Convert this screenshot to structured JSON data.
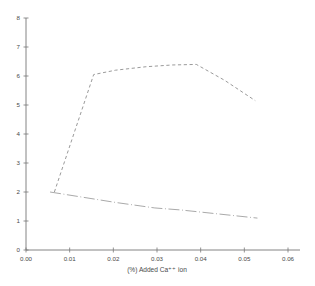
{
  "chart_data": {
    "type": "line",
    "title": "",
    "subtitle": "",
    "xlabel": "(%) Added Ca⁺⁺ ion",
    "ylabel": "",
    "xlim": [
      0.0,
      0.06
    ],
    "ylim": [
      0,
      8
    ],
    "grid": false,
    "legend": "none",
    "x_ticks": [
      0.0,
      0.01,
      0.02,
      0.03,
      0.04,
      0.05,
      0.06
    ],
    "x_tick_labels": [
      "0.00",
      "0.01",
      "0.02",
      "0.03",
      "0.04",
      "0.05",
      "0.06"
    ],
    "y_ticks": [
      0,
      1,
      2,
      3,
      4,
      5,
      6,
      7,
      8
    ],
    "y_tick_labels": [
      "0",
      "1",
      "2",
      "3",
      "4",
      "5",
      "6",
      "7",
      "8"
    ],
    "series": [
      {
        "name": "upper-dashed-curve",
        "style": "dashed",
        "color": "#888888",
        "points": [
          [
            0.0065,
            2.0
          ],
          [
            0.0155,
            6.05
          ],
          [
            0.0205,
            6.2
          ],
          [
            0.0275,
            6.32
          ],
          [
            0.0335,
            6.38
          ],
          [
            0.039,
            6.4
          ],
          [
            0.0455,
            5.85
          ],
          [
            0.0525,
            5.15
          ]
        ]
      },
      {
        "name": "lower-dashdot-line",
        "style": "dash-dot",
        "color": "#999999",
        "points": [
          [
            0.0055,
            2.0
          ],
          [
            0.0205,
            1.64
          ],
          [
            0.0295,
            1.45
          ],
          [
            0.0355,
            1.38
          ],
          [
            0.053,
            1.1
          ]
        ]
      }
    ]
  },
  "axes": {
    "x_axis_name": "x-axis",
    "y_axis_name": "y-axis"
  }
}
